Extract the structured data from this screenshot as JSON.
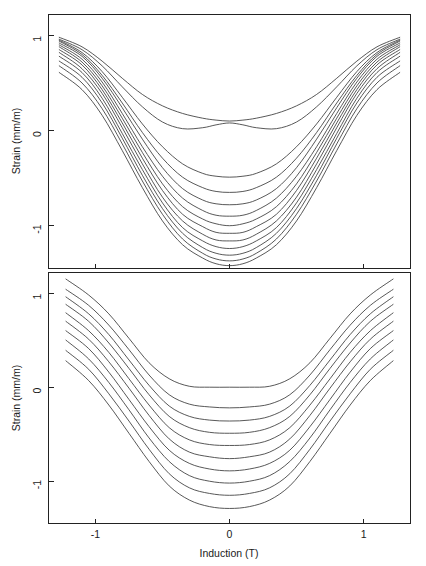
{
  "figure": {
    "width": 426,
    "height": 566,
    "background": "#ffffff",
    "line_color": "#3a3a3a",
    "axis_color": "#222222"
  },
  "chart_data": [
    {
      "type": "line",
      "panel": "top",
      "title": "",
      "xlabel": "",
      "ylabel": "Strain (mm/m)",
      "xlim": [
        -1.35,
        1.35
      ],
      "ylim": [
        -1.45,
        1.22
      ],
      "xticks": [
        -1,
        0,
        1
      ],
      "xticklabels": [
        "-1",
        "0",
        "1"
      ],
      "yticks": [
        -1,
        0,
        1
      ],
      "yticklabels": [
        "-1",
        "0",
        "1"
      ],
      "grid": false,
      "legend": "none",
      "x": [
        -1.27,
        -1.1,
        -0.95,
        -0.8,
        -0.65,
        -0.5,
        -0.35,
        -0.2,
        -0.1,
        0,
        0.1,
        0.2,
        0.35,
        0.5,
        0.65,
        0.8,
        0.95,
        1.1,
        1.27
      ],
      "series": [
        {
          "name": "curve-1",
          "values": [
            0.98,
            0.88,
            0.73,
            0.55,
            0.38,
            0.26,
            0.18,
            0.13,
            0.11,
            0.1,
            0.11,
            0.13,
            0.18,
            0.26,
            0.38,
            0.55,
            0.73,
            0.88,
            0.98
          ]
        },
        {
          "name": "curve-2",
          "values": [
            0.96,
            0.85,
            0.68,
            0.46,
            0.25,
            0.09,
            0.02,
            0.03,
            0.06,
            0.08,
            0.06,
            0.03,
            0.02,
            0.09,
            0.25,
            0.46,
            0.68,
            0.85,
            0.96
          ]
        },
        {
          "name": "curve-3",
          "values": [
            0.95,
            0.82,
            0.62,
            0.35,
            0.07,
            -0.17,
            -0.35,
            -0.45,
            -0.48,
            -0.49,
            -0.48,
            -0.45,
            -0.35,
            -0.17,
            0.07,
            0.35,
            0.62,
            0.82,
            0.95
          ]
        },
        {
          "name": "curve-4",
          "values": [
            0.94,
            0.8,
            0.58,
            0.29,
            -0.02,
            -0.29,
            -0.49,
            -0.6,
            -0.64,
            -0.65,
            -0.64,
            -0.6,
            -0.49,
            -0.29,
            -0.02,
            0.29,
            0.58,
            0.8,
            0.94
          ]
        },
        {
          "name": "curve-5",
          "values": [
            0.92,
            0.78,
            0.55,
            0.24,
            -0.09,
            -0.39,
            -0.61,
            -0.73,
            -0.77,
            -0.78,
            -0.77,
            -0.73,
            -0.61,
            -0.39,
            -0.09,
            0.24,
            0.55,
            0.78,
            0.92
          ]
        },
        {
          "name": "curve-6",
          "values": [
            0.9,
            0.75,
            0.51,
            0.18,
            -0.17,
            -0.48,
            -0.71,
            -0.84,
            -0.89,
            -0.9,
            -0.89,
            -0.84,
            -0.71,
            -0.48,
            -0.17,
            0.18,
            0.51,
            0.75,
            0.9
          ]
        },
        {
          "name": "curve-7",
          "values": [
            0.88,
            0.72,
            0.47,
            0.13,
            -0.23,
            -0.56,
            -0.8,
            -0.93,
            -0.98,
            -1.0,
            -0.98,
            -0.93,
            -0.8,
            -0.56,
            -0.23,
            0.13,
            0.47,
            0.72,
            0.88
          ]
        },
        {
          "name": "curve-8",
          "values": [
            0.85,
            0.69,
            0.43,
            0.08,
            -0.29,
            -0.63,
            -0.88,
            -1.01,
            -1.07,
            -1.08,
            -1.07,
            -1.01,
            -0.88,
            -0.63,
            -0.29,
            0.08,
            0.43,
            0.69,
            0.85
          ]
        },
        {
          "name": "curve-9",
          "values": [
            0.82,
            0.65,
            0.39,
            0.03,
            -0.35,
            -0.7,
            -0.95,
            -1.09,
            -1.15,
            -1.16,
            -1.15,
            -1.09,
            -0.95,
            -0.7,
            -0.35,
            0.03,
            0.39,
            0.65,
            0.82
          ]
        },
        {
          "name": "curve-10",
          "values": [
            0.78,
            0.61,
            0.34,
            -0.03,
            -0.41,
            -0.76,
            -1.02,
            -1.16,
            -1.22,
            -1.24,
            -1.22,
            -1.16,
            -1.02,
            -0.76,
            -0.41,
            -0.03,
            0.34,
            0.61,
            0.78
          ]
        },
        {
          "name": "curve-11",
          "values": [
            0.73,
            0.56,
            0.29,
            -0.08,
            -0.47,
            -0.82,
            -1.08,
            -1.23,
            -1.29,
            -1.31,
            -1.29,
            -1.23,
            -1.08,
            -0.82,
            -0.47,
            -0.08,
            0.29,
            0.56,
            0.73
          ]
        },
        {
          "name": "curve-12",
          "values": [
            0.68,
            0.5,
            0.23,
            -0.14,
            -0.53,
            -0.88,
            -1.14,
            -1.29,
            -1.35,
            -1.37,
            -1.35,
            -1.29,
            -1.14,
            -0.88,
            -0.53,
            -0.14,
            0.23,
            0.5,
            0.68
          ]
        },
        {
          "name": "curve-13",
          "values": [
            0.61,
            0.43,
            0.16,
            -0.21,
            -0.6,
            -0.95,
            -1.2,
            -1.34,
            -1.4,
            -1.42,
            -1.4,
            -1.34,
            -1.2,
            -0.95,
            -0.6,
            -0.21,
            0.16,
            0.43,
            0.61
          ]
        }
      ]
    },
    {
      "type": "line",
      "panel": "bottom",
      "title": "",
      "xlabel": "Induction (T)",
      "ylabel": "Strain (mm/m)",
      "xlim": [
        -1.35,
        1.35
      ],
      "ylim": [
        -1.45,
        1.22
      ],
      "xticks": [
        -1,
        0,
        1
      ],
      "xticklabels": [
        "-1",
        "0",
        "1"
      ],
      "yticks": [
        -1,
        0,
        1
      ],
      "yticklabels": [
        "-1",
        "0",
        "1"
      ],
      "grid": false,
      "legend": "none",
      "x": [
        -1.22,
        -1.05,
        -0.9,
        -0.75,
        -0.6,
        -0.45,
        -0.3,
        -0.15,
        0,
        0.15,
        0.3,
        0.45,
        0.6,
        0.75,
        0.9,
        1.05,
        1.22
      ],
      "series": [
        {
          "name": "curve-1",
          "values": [
            1.15,
            0.98,
            0.78,
            0.52,
            0.26,
            0.09,
            0.01,
            0.0,
            0.0,
            0.0,
            0.01,
            0.09,
            0.26,
            0.52,
            0.78,
            0.98,
            1.15
          ]
        },
        {
          "name": "curve-2",
          "values": [
            1.04,
            0.87,
            0.66,
            0.4,
            0.13,
            -0.08,
            -0.18,
            -0.21,
            -0.22,
            -0.21,
            -0.18,
            -0.08,
            0.13,
            0.4,
            0.66,
            0.87,
            1.04
          ]
        },
        {
          "name": "curve-3",
          "values": [
            0.96,
            0.78,
            0.56,
            0.29,
            0.02,
            -0.2,
            -0.31,
            -0.35,
            -0.36,
            -0.35,
            -0.31,
            -0.2,
            0.02,
            0.29,
            0.56,
            0.78,
            0.96
          ]
        },
        {
          "name": "curve-4",
          "values": [
            0.88,
            0.7,
            0.47,
            0.2,
            -0.08,
            -0.31,
            -0.43,
            -0.48,
            -0.49,
            -0.48,
            -0.43,
            -0.31,
            -0.08,
            0.2,
            0.47,
            0.7,
            0.88
          ]
        },
        {
          "name": "curve-5",
          "values": [
            0.79,
            0.6,
            0.37,
            0.09,
            -0.19,
            -0.43,
            -0.56,
            -0.61,
            -0.62,
            -0.61,
            -0.56,
            -0.43,
            -0.19,
            0.09,
            0.37,
            0.6,
            0.79
          ]
        },
        {
          "name": "curve-6",
          "values": [
            0.7,
            0.51,
            0.27,
            -0.01,
            -0.3,
            -0.55,
            -0.69,
            -0.74,
            -0.76,
            -0.74,
            -0.69,
            -0.55,
            -0.3,
            -0.01,
            0.27,
            0.51,
            0.7
          ]
        },
        {
          "name": "curve-7",
          "values": [
            0.6,
            0.41,
            0.16,
            -0.13,
            -0.42,
            -0.67,
            -0.81,
            -0.87,
            -0.89,
            -0.87,
            -0.81,
            -0.67,
            -0.42,
            -0.13,
            0.16,
            0.41,
            0.6
          ]
        },
        {
          "name": "curve-8",
          "values": [
            0.5,
            0.3,
            0.05,
            -0.24,
            -0.54,
            -0.79,
            -0.94,
            -1.0,
            -1.02,
            -1.0,
            -0.94,
            -0.79,
            -0.54,
            -0.24,
            0.05,
            0.3,
            0.5
          ]
        },
        {
          "name": "curve-9",
          "values": [
            0.39,
            0.19,
            -0.07,
            -0.36,
            -0.66,
            -0.92,
            -1.07,
            -1.13,
            -1.15,
            -1.13,
            -1.07,
            -0.92,
            -0.66,
            -0.36,
            -0.07,
            0.19,
            0.39
          ]
        },
        {
          "name": "curve-10",
          "values": [
            0.28,
            0.07,
            -0.19,
            -0.49,
            -0.79,
            -1.05,
            -1.2,
            -1.27,
            -1.29,
            -1.27,
            -1.2,
            -1.05,
            -0.79,
            -0.49,
            -0.19,
            0.07,
            0.28
          ]
        }
      ]
    }
  ],
  "axes": {
    "top": {
      "ylabel": "Strain (mm/m)",
      "ytick_labels": [
        "1",
        "0",
        "-1"
      ],
      "xtick_labels": [
        "-1",
        "0",
        "1"
      ]
    },
    "bottom": {
      "ylabel": "Strain (mm/m)",
      "xlabel": "Induction (T)",
      "ytick_labels": [
        "1",
        "0",
        "-1"
      ],
      "xtick_labels": [
        "-1",
        "0",
        "1"
      ]
    }
  }
}
